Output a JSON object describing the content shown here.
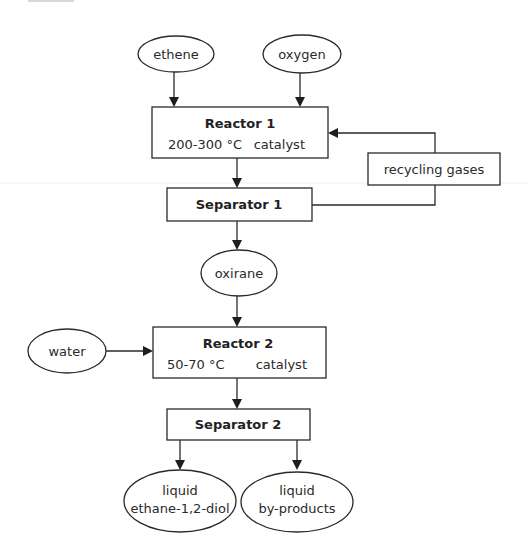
{
  "diagram": {
    "type": "process-flowchart",
    "colors": {
      "stroke": "#2a2a2a",
      "text": "#222222",
      "background": "#ffffff"
    },
    "inputs": {
      "ethene": {
        "label": "ethene"
      },
      "oxygen": {
        "label": "oxygen"
      },
      "water": {
        "label": "water"
      }
    },
    "reactor1": {
      "title": "Reactor 1",
      "temperature": "200-300 °C",
      "condition": "catalyst"
    },
    "recycling": {
      "label": "recycling gases"
    },
    "separator1": {
      "title": "Separator 1"
    },
    "intermediate": {
      "label": "oxirane"
    },
    "reactor2": {
      "title": "Reactor 2",
      "temperature": "50-70 °C",
      "condition": "catalyst"
    },
    "separator2": {
      "title": "Separator 2"
    },
    "outputs": {
      "product": {
        "line1": "liquid",
        "line2": "ethane-1,2-diol"
      },
      "byproducts": {
        "line1": "liquid",
        "line2": "by-products"
      }
    },
    "edges": [
      {
        "from": "ethene",
        "to": "Reactor 1"
      },
      {
        "from": "oxygen",
        "to": "Reactor 1"
      },
      {
        "from": "Reactor 1",
        "to": "Separator 1"
      },
      {
        "from": "Separator 1",
        "to": "recycling gases"
      },
      {
        "from": "recycling gases",
        "to": "Reactor 1"
      },
      {
        "from": "Separator 1",
        "to": "oxirane"
      },
      {
        "from": "oxirane",
        "to": "Reactor 2"
      },
      {
        "from": "water",
        "to": "Reactor 2"
      },
      {
        "from": "Reactor 2",
        "to": "Separator 2"
      },
      {
        "from": "Separator 2",
        "to": "liquid ethane-1,2-diol"
      },
      {
        "from": "Separator 2",
        "to": "liquid by-products"
      }
    ]
  }
}
